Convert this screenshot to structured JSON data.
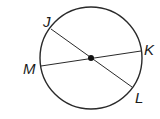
{
  "diagram": {
    "type": "circle-with-chords",
    "center": {
      "x": 91,
      "y": 58,
      "dot": true
    },
    "radius": 51,
    "colors": {
      "stroke": "#2a2a2a",
      "label": "#1a1a1a",
      "background": "#ffffff"
    },
    "points": [
      {
        "id": "J",
        "label": "J",
        "x": 51,
        "y": 29,
        "label_x": 43,
        "label_y": 27
      },
      {
        "id": "K",
        "label": "K",
        "x": 141,
        "y": 51,
        "label_x": 144,
        "label_y": 55
      },
      {
        "id": "M",
        "label": "M",
        "x": 41,
        "y": 66,
        "label_x": 23,
        "label_y": 74
      },
      {
        "id": "L",
        "label": "L",
        "x": 132,
        "y": 87,
        "label_x": 135,
        "label_y": 103
      }
    ],
    "segments": [
      {
        "from": "J",
        "to": "L",
        "through_center": true
      },
      {
        "from": "M",
        "to": "K",
        "through_center": true
      }
    ]
  }
}
